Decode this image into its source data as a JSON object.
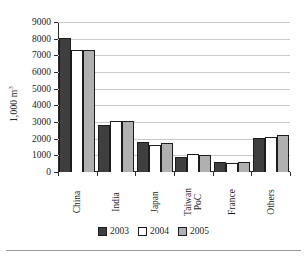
{
  "chart_data": {
    "type": "bar",
    "title": "",
    "xlabel": "",
    "ylabel": "1,000 m",
    "ylabel_superscript": "3",
    "categories": [
      "China",
      "India",
      "Japan",
      "Taiwan PoC",
      "France",
      "Others"
    ],
    "category_lines": [
      [
        "China"
      ],
      [
        "India"
      ],
      [
        "Japan"
      ],
      [
        "Taiwan",
        "PoC"
      ],
      [
        "France"
      ],
      [
        "Others"
      ]
    ],
    "series": [
      {
        "name": "2003",
        "color": "#3f3f3f",
        "values": [
          8050,
          2800,
          1820,
          930,
          620,
          2040
        ]
      },
      {
        "name": "2004",
        "color": "#ffffff",
        "values": [
          7320,
          3050,
          1600,
          1090,
          520,
          2120
        ]
      },
      {
        "name": "2005",
        "color": "#b0b0b0",
        "values": [
          7330,
          3050,
          1720,
          1050,
          600,
          2230
        ]
      }
    ],
    "ylim": [
      0,
      9000
    ],
    "yticks": [
      0,
      1000,
      2000,
      3000,
      4000,
      5000,
      6000,
      7000,
      8000,
      9000
    ],
    "ytick_labels": [
      "0",
      "1000",
      "2000",
      "3000",
      "4000",
      "5000",
      "6000",
      "7000",
      "8000",
      "9000"
    ],
    "grid": true,
    "grid_axis": "y",
    "legend_position": "bottom",
    "legend_entries": [
      "2003",
      "2004",
      "2005"
    ]
  }
}
